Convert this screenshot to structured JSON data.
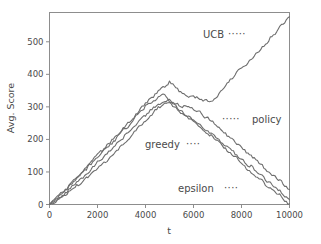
{
  "chart_data": {
    "type": "line",
    "title": "",
    "xlabel": "t",
    "ylabel": "Avg. Score",
    "xlim": [
      0,
      10000
    ],
    "ylim": [
      0,
      590
    ],
    "xticks": [
      0,
      2000,
      4000,
      6000,
      8000,
      10000
    ],
    "xticklabels": [
      "0",
      "2000",
      "4000",
      "6000",
      "8000",
      "10000"
    ],
    "yticks": [
      0,
      100,
      200,
      300,
      400,
      500
    ],
    "yticklabels": [
      "0",
      "100",
      "200",
      "300",
      "400",
      "500"
    ],
    "grid": false,
    "legend_position": "inline-annotations",
    "line_color": "#6e6e6e",
    "frame_color": "#8d8d8d",
    "annotations": [
      {
        "name": "ucb",
        "label": "UCB",
        "leader": "·····",
        "leader_side": "right"
      },
      {
        "name": "policy",
        "label": "policy",
        "leader": "·····",
        "leader_side": "left"
      },
      {
        "name": "greedy",
        "label": "greedy",
        "leader": "····",
        "leader_side": "right"
      },
      {
        "name": "epsilon",
        "label": "epsilon",
        "leader": "····",
        "leader_side": "right"
      }
    ],
    "series": [
      {
        "name": "ucb",
        "label": "UCB",
        "color": "#6e6e6e",
        "x": [
          0,
          200,
          400,
          600,
          800,
          1000,
          1200,
          1400,
          1600,
          1800,
          2000,
          2200,
          2400,
          2600,
          2800,
          3000,
          3200,
          3400,
          3600,
          3800,
          4000,
          4200,
          4400,
          4600,
          4800,
          5000,
          5200,
          5400,
          5600,
          5800,
          6000,
          6200,
          6400,
          6600,
          6800,
          7000,
          7200,
          7400,
          7600,
          7800,
          8000,
          8200,
          8400,
          8600,
          8800,
          9000,
          9200,
          9400,
          9600,
          9800,
          10000
        ],
        "y": [
          0,
          13,
          26,
          42,
          55,
          72,
          88,
          103,
          118,
          133,
          150,
          166,
          181,
          196,
          211,
          228,
          244,
          260,
          276,
          292,
          308,
          322,
          336,
          350,
          364,
          376,
          362,
          350,
          340,
          334,
          330,
          326,
          322,
          320,
          323,
          335,
          355,
          372,
          390,
          404,
          418,
          432,
          446,
          462,
          478,
          494,
          510,
          527,
          544,
          560,
          577
        ]
      },
      {
        "name": "policy",
        "label": "policy",
        "color": "#6e6e6e",
        "x": [
          0,
          200,
          400,
          600,
          800,
          1000,
          1200,
          1400,
          1600,
          1800,
          2000,
          2200,
          2400,
          2600,
          2800,
          3000,
          3200,
          3400,
          3600,
          3800,
          4000,
          4200,
          4400,
          4600,
          4800,
          5000,
          5200,
          5400,
          5600,
          5800,
          6000,
          6200,
          6400,
          6600,
          6800,
          7000,
          7200,
          7400,
          7600,
          7800,
          8000,
          8200,
          8400,
          8600,
          8800,
          9000,
          9200,
          9400,
          9600,
          9800,
          10000
        ],
        "y": [
          0,
          12,
          25,
          38,
          52,
          68,
          84,
          98,
          113,
          128,
          144,
          160,
          175,
          190,
          205,
          221,
          237,
          253,
          269,
          285,
          300,
          312,
          322,
          332,
          340,
          318,
          312,
          306,
          300,
          298,
          296,
          288,
          276,
          264,
          252,
          240,
          228,
          214,
          200,
          188,
          176,
          163,
          150,
          137,
          124,
          110,
          96,
          84,
          72,
          58,
          46
        ]
      },
      {
        "name": "greedy",
        "label": "greedy",
        "color": "#6e6e6e",
        "x": [
          0,
          200,
          400,
          600,
          800,
          1000,
          1200,
          1400,
          1600,
          1800,
          2000,
          2200,
          2400,
          2600,
          2800,
          3000,
          3200,
          3400,
          3600,
          3800,
          4000,
          4200,
          4400,
          4600,
          4800,
          5000,
          5200,
          5400,
          5600,
          5800,
          6000,
          6200,
          6400,
          6600,
          6800,
          7000,
          7200,
          7400,
          7600,
          7800,
          8000,
          8200,
          8400,
          8600,
          8800,
          9000,
          9200,
          9400,
          9600,
          9800,
          10000
        ],
        "y": [
          0,
          10,
          20,
          32,
          45,
          58,
          72,
          86,
          100,
          114,
          128,
          142,
          157,
          172,
          187,
          202,
          217,
          232,
          247,
          262,
          276,
          288,
          298,
          308,
          316,
          322,
          304,
          292,
          282,
          272,
          262,
          250,
          238,
          226,
          214,
          202,
          190,
          178,
          166,
          152,
          140,
          128,
          116,
          104,
          90,
          76,
          64,
          52,
          40,
          26,
          15
        ]
      },
      {
        "name": "epsilon",
        "label": "epsilon",
        "color": "#6e6e6e",
        "x": [
          0,
          200,
          400,
          600,
          800,
          1000,
          1200,
          1400,
          1600,
          1800,
          2000,
          2200,
          2400,
          2600,
          2800,
          3000,
          3200,
          3400,
          3600,
          3800,
          4000,
          4200,
          4400,
          4600,
          4800,
          5000,
          5200,
          5400,
          5600,
          5800,
          6000,
          6200,
          6400,
          6600,
          6800,
          7000,
          7200,
          7400,
          7600,
          7800,
          8000,
          8200,
          8400,
          8600,
          8800,
          9000,
          9200,
          9400,
          9600,
          9800,
          10000
        ],
        "y": [
          0,
          8,
          17,
          27,
          38,
          50,
          62,
          74,
          86,
          98,
          110,
          122,
          136,
          150,
          164,
          180,
          196,
          212,
          228,
          244,
          260,
          275,
          288,
          300,
          310,
          318,
          300,
          288,
          276,
          266,
          256,
          244,
          232,
          220,
          208,
          194,
          182,
          168,
          156,
          142,
          128,
          114,
          100,
          88,
          74,
          60,
          52,
          40,
          28,
          12,
          2
        ]
      }
    ]
  }
}
